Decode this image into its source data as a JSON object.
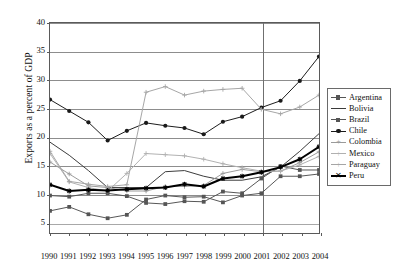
{
  "chart_data": {
    "type": "line",
    "title": "",
    "xlabel": "",
    "ylabel": "Exports as a percent of GDP",
    "x": [
      1990,
      1991,
      1992,
      1993,
      1994,
      1995,
      1996,
      1997,
      1998,
      1999,
      2000,
      2001,
      2002,
      2003,
      2004
    ],
    "xticklabels": [
      "1990",
      "1991",
      "1992",
      "1993",
      "1994",
      "1995",
      "1996",
      "1997",
      "1998",
      "1999",
      "2000",
      "2001",
      "2002",
      "2003",
      "2004"
    ],
    "yticks": [
      5,
      10,
      15,
      20,
      25,
      30,
      35,
      40
    ],
    "ylim": [
      3.0,
      40.0
    ],
    "xlim": [
      1990,
      2004
    ],
    "grid": "horizontal",
    "legend_position": "right-outside",
    "annotations": [
      {
        "type": "vertical-line",
        "x": 2001,
        "label": ""
      }
    ],
    "series": [
      {
        "name": "Argentina",
        "color": "#555555",
        "marker": "square",
        "width": 1,
        "values": [
          6.9,
          7.6,
          6.3,
          5.6,
          6.2,
          8.9,
          9.6,
          9.3,
          9.4,
          8.4,
          9.6,
          10.0,
          13.0,
          13.0,
          13.4
        ]
      },
      {
        "name": "Bolivia",
        "color": "#3a3a3a",
        "marker": "none",
        "width": 1,
        "values": [
          19.0,
          16.7,
          14.0,
          11.0,
          11.0,
          11.0,
          13.8,
          14.0,
          13.0,
          12.3,
          12.3,
          12.9,
          14.6,
          17.4,
          20.5
        ]
      },
      {
        "name": "Brazil",
        "color": "#555555",
        "marker": "square",
        "width": 1,
        "values": [
          9.6,
          9.4,
          10.0,
          10.0,
          9.5,
          8.3,
          8.1,
          8.6,
          8.5,
          10.3,
          10.0,
          12.6,
          14.8,
          14.1,
          14.1
        ]
      },
      {
        "name": "Chile",
        "color": "#1a1a1a",
        "marker": "circle",
        "width": 1,
        "values": [
          26.5,
          24.5,
          22.5,
          19.3,
          21.0,
          22.4,
          21.9,
          21.5,
          20.4,
          22.6,
          23.5,
          25.1,
          26.3,
          29.8,
          34.1
        ]
      },
      {
        "name": "Colombia",
        "color": "#9a9a9a",
        "marker": "plus",
        "width": 1,
        "values": [
          15.5,
          13.4,
          11.3,
          11.0,
          10.4,
          10.4,
          11.2,
          11.2,
          11.4,
          13.5,
          14.2,
          13.8,
          13.9,
          15.4,
          17.3
        ]
      },
      {
        "name": "Mexico",
        "color": "#b0b0b0",
        "marker": "plus",
        "width": 1,
        "values": [
          17.0,
          12.0,
          11.0,
          10.4,
          13.5,
          17.0,
          16.8,
          16.6,
          16.0,
          15.2,
          14.5,
          13.9,
          13.9,
          15.0,
          16.5
        ]
      },
      {
        "name": "Paraguay",
        "color": "#a5a5a5",
        "marker": "plus",
        "width": 1,
        "values": [
          17.4,
          12.1,
          11.6,
          11.2,
          11.5,
          27.8,
          28.8,
          27.3,
          28.0,
          28.3,
          28.5,
          24.8,
          24.0,
          25.2,
          27.3
        ]
      },
      {
        "name": "Peru",
        "color": "#000000",
        "marker": "star",
        "width": 2,
        "values": [
          11.5,
          10.4,
          10.6,
          10.5,
          10.7,
          10.9,
          11.0,
          11.6,
          11.2,
          12.6,
          13.0,
          13.7,
          14.6,
          16.0,
          18.2
        ]
      }
    ]
  },
  "legend": {
    "items": [
      {
        "label": "Argentina"
      },
      {
        "label": "Bolivia"
      },
      {
        "label": "Brazil"
      },
      {
        "label": "Chile"
      },
      {
        "label": "Colombia"
      },
      {
        "label": "Mexico"
      },
      {
        "label": "Paraguay"
      },
      {
        "label": "Peru"
      }
    ]
  }
}
